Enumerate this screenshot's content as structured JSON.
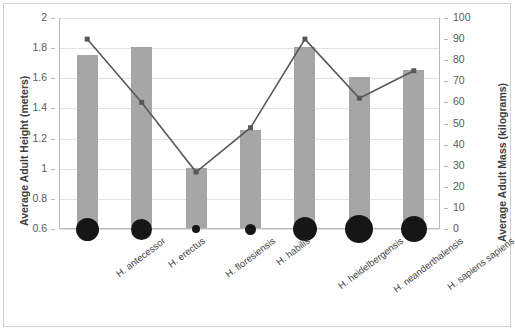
{
  "chart_data": {
    "type": "bar",
    "title": "",
    "subtitle": "",
    "categories": [
      "H. antecessor",
      "H. erectus",
      "H. floresiensis",
      "H. habilis",
      "H. heidelbergensis",
      "H. neanderthalensis",
      "H. sapiens sapiens"
    ],
    "series": [
      {
        "name": "Average Adult Height (meters)",
        "type": "bar",
        "axis": "left",
        "color": "#a6a6a6",
        "values": [
          1.75,
          1.8,
          1.0,
          1.25,
          1.8,
          1.6,
          1.65
        ]
      },
      {
        "name": "Average Adult Mass (kilograms)",
        "type": "line",
        "axis": "right",
        "color": "#595959",
        "marker": "square",
        "values": [
          90,
          60,
          27,
          48,
          90,
          62,
          75
        ]
      },
      {
        "name": "Relative Cranial Capacity",
        "type": "bubble",
        "axis": "left",
        "color": "#161616",
        "sizes_px": [
          23,
          21,
          8,
          11,
          24,
          28,
          26
        ]
      }
    ],
    "xlabel": "",
    "ylabel_left": "Average Adult Height (meters)",
    "ylabel_right": "Average Adult Mass (kilograms)",
    "ylim_left": [
      0.6,
      2.0
    ],
    "ylim_right": [
      0,
      100
    ],
    "yticks_left": [
      "2",
      "1.8",
      "1.6",
      "1.4",
      "1.2",
      "1",
      "0.8",
      "0.6"
    ],
    "yticks_right": [
      "100",
      "90",
      "80",
      "70",
      "60",
      "50",
      "40",
      "30",
      "20",
      "10",
      "0"
    ],
    "grid": true,
    "legend": "none"
  },
  "axes": {
    "left_title": "Average Adult Height (meters)",
    "right_title": "Average Adult Mass (kilograms)"
  }
}
